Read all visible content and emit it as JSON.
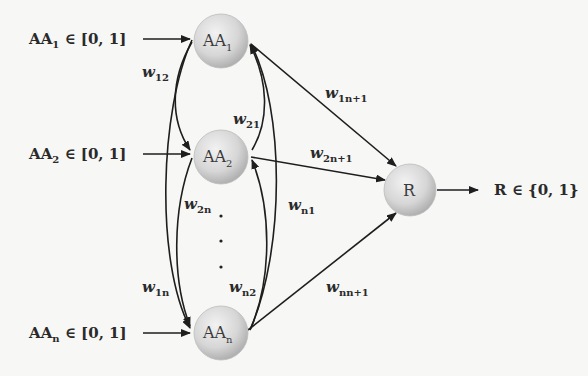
{
  "diagram": {
    "type": "neural network / weighted graph",
    "inputs": [
      {
        "id": "in1",
        "label_main": "AA",
        "label_sub": "1",
        "label_rest": " ∈ [0, 1]"
      },
      {
        "id": "in2",
        "label_main": "AA",
        "label_sub": "2",
        "label_rest": " ∈ [0, 1]"
      },
      {
        "id": "inn",
        "label_main": "AA",
        "label_sub": "n",
        "label_rest": " ∈ [0, 1]"
      }
    ],
    "nodes": [
      {
        "id": "AA1",
        "main": "AA",
        "sub": "1"
      },
      {
        "id": "AA2",
        "main": "AA",
        "sub": "2"
      },
      {
        "id": "AAn",
        "main": "AA",
        "sub": "n"
      },
      {
        "id": "R",
        "main": "R",
        "sub": ""
      }
    ],
    "ellipsis": "⋮",
    "output": {
      "label_main": "R",
      "label_rest": " ∈ {0, 1}"
    },
    "weights": [
      {
        "id": "w12",
        "main": "w",
        "sub": "12"
      },
      {
        "id": "w21",
        "main": "w",
        "sub": "21"
      },
      {
        "id": "w2n",
        "main": "w",
        "sub": "2n"
      },
      {
        "id": "wn1",
        "main": "w",
        "sub": "n1"
      },
      {
        "id": "w1n",
        "main": "w",
        "sub": "1n"
      },
      {
        "id": "wn2",
        "main": "w",
        "sub": "n2"
      },
      {
        "id": "w1n1",
        "main": "w",
        "sub": "1n+1"
      },
      {
        "id": "w2n1",
        "main": "w",
        "sub": "2n+1"
      },
      {
        "id": "wnn1",
        "main": "w",
        "sub": "nn+1"
      }
    ],
    "colors": {
      "node_fill_light": "#ececec",
      "node_fill_dark": "#b9b9b9",
      "edge": "#1e1e1e",
      "background": "#f7f7f5"
    }
  }
}
